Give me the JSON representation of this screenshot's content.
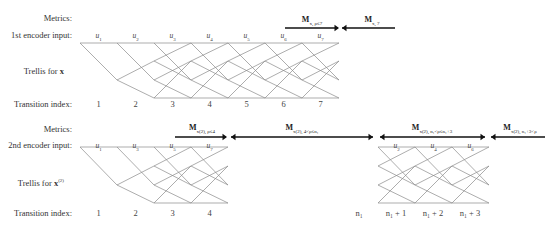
{
  "row_labels": {
    "metrics": "Metrics:",
    "enc1_input": "1st encoder input:",
    "trellis_x": "Trellis for ",
    "trellis_x_sym": "x",
    "transition_index": "Transition index:",
    "enc2_input": "2nd encoder input:",
    "trellis_x2_sym": "x",
    "trellis_x2_sup": "(2)"
  },
  "top": {
    "inputs": [
      "u",
      "u",
      "u",
      "u",
      "u",
      "u",
      "u"
    ],
    "input_subs": [
      "1",
      "2",
      "3",
      "4",
      "5",
      "6",
      "7"
    ],
    "indices": [
      "1",
      "2",
      "3",
      "4",
      "5",
      "6",
      "7"
    ],
    "metrics": [
      {
        "main": "M",
        "sub": "x, ρ≤7",
        "direction": "right"
      },
      {
        "main": "M",
        "sub": "x, 7<j",
        "direction": "left"
      }
    ]
  },
  "bottom": {
    "inputs_left": [
      "u",
      "u",
      "u",
      "u"
    ],
    "input_subs_left": [
      "1",
      "3",
      "5",
      "7"
    ],
    "indices_left": [
      "1",
      "2",
      "3",
      "4"
    ],
    "inputs_right": [
      "u",
      "u",
      "u"
    ],
    "input_subs_right": [
      "2",
      "4",
      "6"
    ],
    "indices_right": [
      "n₁",
      "n₁ + 1",
      "n₁ + 2",
      "n₁ + 3"
    ],
    "metrics": [
      {
        "main": "M",
        "sub": "x(2), ρ≤4",
        "direction": "right"
      },
      {
        "main": "M",
        "sub": "x(2), 4<ρ≤n₁",
        "direction": "left"
      },
      {
        "main": "M",
        "sub": "x(2), n₁<ρ≤n₁+3",
        "direction": "left"
      },
      {
        "main": "M",
        "sub": "x(2), n₁+3<ρ",
        "direction": "left"
      }
    ]
  }
}
